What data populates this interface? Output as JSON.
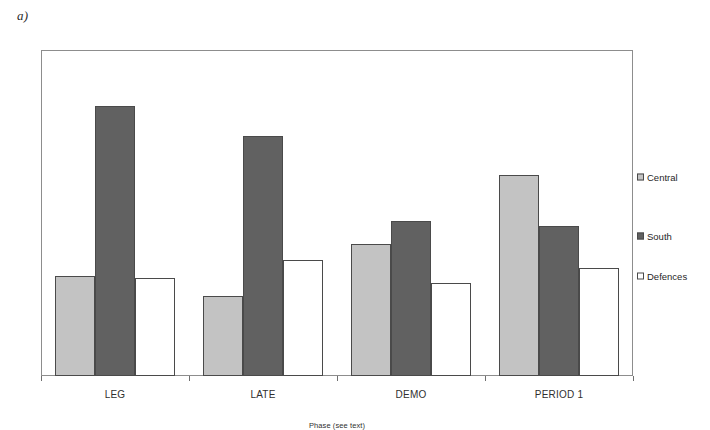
{
  "panel": {
    "label": "a)"
  },
  "chart_data": {
    "type": "bar",
    "title": "",
    "subtitle": "",
    "xlabel": "Phase (see text)",
    "ylabel": "",
    "categories": [
      "LEG",
      "LATE",
      "DEMO",
      "PERIOD 1"
    ],
    "series": [
      {
        "name": "Central",
        "values": [
          7.7,
          6.1,
          10.1,
          15.4
        ],
        "color": "#c3c3c3"
      },
      {
        "name": "South",
        "values": [
          20.7,
          18.4,
          11.9,
          11.5
        ],
        "color": "#616161"
      },
      {
        "name": "Defences",
        "values": [
          7.5,
          8.9,
          7.1,
          8.3
        ],
        "color": "#ffffff"
      }
    ],
    "ylim": [
      0,
      25
    ],
    "yticks": [
      0,
      5,
      10,
      15,
      20,
      25
    ],
    "ytick_labels": [
      "0",
      "5",
      "10",
      "15",
      "20",
      "25"
    ],
    "grid": false,
    "legend_position": "right",
    "bar_border_color": "#4a4a4a",
    "frame_color": "#8d8d8d"
  },
  "legend": {
    "entries": [
      {
        "label": "Central",
        "swatch": "#c3c3c3"
      },
      {
        "label": "South",
        "swatch": "#616161"
      },
      {
        "label": "Defences",
        "swatch": "#ffffff"
      }
    ]
  }
}
